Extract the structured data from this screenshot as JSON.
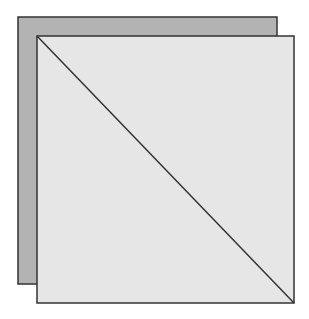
{
  "diagram": {
    "background_color": "#ffffff",
    "back_square": {
      "x": 18,
      "y": 17,
      "width": 259,
      "height": 267,
      "fill": "#b3b3b3",
      "stroke": "#333333"
    },
    "front_square": {
      "x": 37,
      "y": 36,
      "width": 257,
      "height": 267,
      "fill": "#e6e6e6",
      "stroke": "#333333"
    },
    "diagonal": {
      "x1": 37,
      "y1": 36,
      "x2": 294,
      "y2": 303,
      "stroke": "#333333"
    }
  }
}
